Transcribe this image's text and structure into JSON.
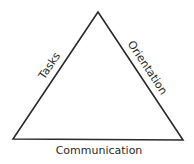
{
  "diagram": {
    "type": "triangle",
    "vertices": {
      "apex": [
        98,
        12
      ],
      "bottom_left": [
        13,
        139
      ],
      "bottom_right": [
        183,
        140
      ]
    },
    "stroke_color": "#2a2a2a",
    "text_color": "#2a2a2a",
    "labels": {
      "left_side": "Tasks",
      "right_side": "Orientation",
      "bottom_side": "Communication"
    }
  }
}
